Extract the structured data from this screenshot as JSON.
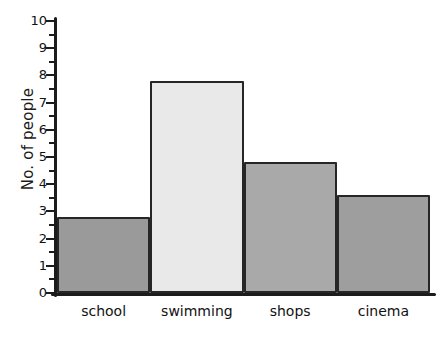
{
  "chart_data": {
    "type": "bar",
    "title": "",
    "xlabel": "",
    "ylabel": "No. of people",
    "categories": [
      "school",
      "swimming",
      "shops",
      "cinema"
    ],
    "values": [
      2.8,
      7.8,
      4.8,
      3.6
    ],
    "ylim": [
      0,
      10
    ],
    "ytick_labels": [
      "0",
      "1",
      "2",
      "3",
      "4",
      "5",
      "6",
      "7",
      "8",
      "9",
      "10"
    ],
    "ytick_values": [
      0,
      1,
      2,
      3,
      4,
      5,
      6,
      7,
      8,
      9,
      10
    ],
    "grid": false,
    "legend": false,
    "bar_colors": [
      "#9a9a9a",
      "#e9e9e9",
      "#a9a9a9",
      "#9e9e9e"
    ],
    "bar_edge_color": "#262626",
    "axis_color": "#1c1c1c",
    "background": "#ffffff",
    "style": "hand-drawn"
  }
}
